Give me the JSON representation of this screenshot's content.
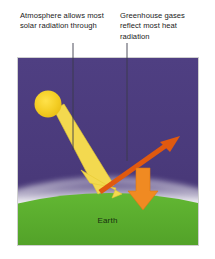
{
  "figure": {
    "captions": {
      "left": "Atmosphere allows most solar radiation through",
      "right": "Greenhouse gases reflect most heat radiation"
    },
    "panel": {
      "earth_label": "Earth",
      "elements": {
        "sun": "sun-circle",
        "solar_beam": "solar-radiation-arrow",
        "reflected_beam": "escaping-heat-arrow",
        "trapped_beam": "reflected-heat-arrow",
        "atmosphere": "atmosphere-glow-band",
        "ground": "earth-surface"
      }
    },
    "colors": {
      "sky": "#4c3c7d",
      "sky_dark": "#443371",
      "ground": "#5aae2e",
      "ground_dark": "#4e9c27",
      "sun": "#f2cc23",
      "solar_arrow": "#f5dc5a",
      "solar_arrow_edge": "#e8c93c",
      "heat_arrow_dark": "#e05a10",
      "heat_arrow_light": "#f08a22",
      "atmosphere": "#ffffff",
      "leader_line": "#3a3a4a",
      "text": "#1a1a1a",
      "earth_text": "#17300f",
      "panel_border": "#cfcfcf",
      "background": "#ffffff"
    }
  }
}
